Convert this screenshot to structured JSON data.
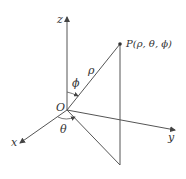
{
  "diagram": {
    "labels": {
      "z_axis": "z",
      "x_axis": "x",
      "y_axis": "y",
      "origin": "O",
      "point": "P(ρ, θ, ϕ)",
      "rho": "ρ",
      "phi": "ϕ",
      "theta": "θ"
    },
    "colors": {
      "line": "#444444",
      "text": "#333333",
      "background": "#ffffff"
    }
  }
}
